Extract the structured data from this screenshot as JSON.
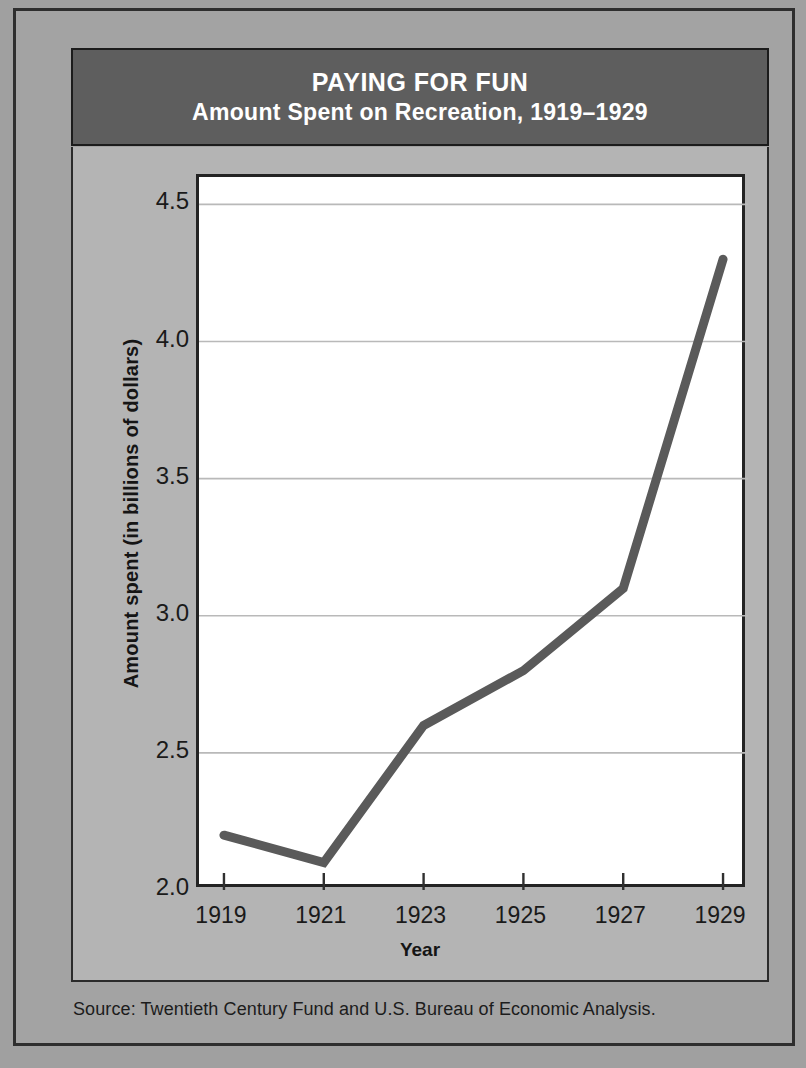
{
  "figure": {
    "title_main": "PAYING FOR FUN",
    "title_sub": "Amount Spent on Recreation, 1919–1929",
    "source_note": "Source: Twentieth Century Fund and U.S. Bureau of Economic Analysis.",
    "banner_bg": "#5e5e5e",
    "card_bg": "#b4b4b4",
    "plot_bg": "#ffffff",
    "line_color": "#5a5a5a",
    "frame_color": "#2b2b2b"
  },
  "chart_data": {
    "type": "line",
    "xlabel": "Year",
    "ylabel": "Amount spent (in billions of dollars)",
    "x": [
      1919,
      1921,
      1923,
      1925,
      1927,
      1929
    ],
    "values": [
      2.2,
      2.1,
      2.6,
      2.8,
      3.1,
      4.3
    ],
    "categories": [
      "1919",
      "1921",
      "1923",
      "1925",
      "1927",
      "1929"
    ],
    "xtick_labels": [
      "1919",
      "1921",
      "1923",
      "1925",
      "1927",
      "1929"
    ],
    "ytick_labels": [
      "4.5",
      "4.0",
      "3.5",
      "3.0",
      "2.5",
      "2.0"
    ],
    "yticks": [
      4.5,
      4.0,
      3.5,
      3.0,
      2.5,
      2.0
    ],
    "ylim": [
      2.0,
      4.6
    ],
    "xlim": [
      1918.5,
      1929.5
    ],
    "grid": true,
    "grid_axis": "y",
    "legend": false,
    "series": [
      {
        "name": "Amount spent on recreation",
        "values": [
          2.2,
          2.1,
          2.6,
          2.8,
          3.1,
          4.3
        ]
      }
    ]
  }
}
